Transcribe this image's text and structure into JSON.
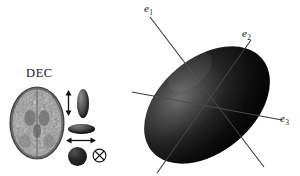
{
  "figure": {
    "background_color": "#ffffff",
    "width": 300,
    "height": 176
  },
  "left_panel": {
    "map_label": "DEC",
    "brain_slice": {
      "name": "axial-brain-slice",
      "modality": "diffusion-tensor-imaging",
      "grayscale": true
    },
    "legend": {
      "rows": [
        {
          "shape": "prolate-ellipsoid",
          "orientation": "vertical",
          "arrow": "double-arrow-vertical",
          "arrow_glyph": "↕"
        },
        {
          "shape": "oblate-ellipsoid",
          "orientation": "horizontal",
          "arrow": "double-arrow-horizontal",
          "arrow_glyph": "↔"
        },
        {
          "shape": "isotropic-sphere",
          "orientation": "none",
          "arrow": "circled-cross-through-plane",
          "arrow_glyph": "⊗"
        }
      ]
    }
  },
  "right_panel": {
    "object": "diffusion-tensor-ellipsoid",
    "fill_color": "#0d0d0d",
    "axes": [
      {
        "id": "e1",
        "base": "e",
        "sub": "1",
        "label": "e₁",
        "role": "primary-eigenvector"
      },
      {
        "id": "e2",
        "base": "e",
        "sub": "2",
        "label": "e₂",
        "role": "secondary-eigenvector"
      },
      {
        "id": "e3",
        "base": "e",
        "sub": "3",
        "label": "e₃",
        "role": "tertiary-eigenvector"
      }
    ],
    "ellipsoid_geometry": {
      "center_x": 77,
      "center_y": 105,
      "semi_major": 72,
      "semi_minor": 47,
      "rotation_deg": -40
    }
  }
}
